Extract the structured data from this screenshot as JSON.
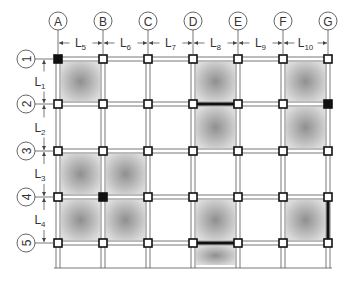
{
  "diagram": {
    "type": "structural-grid-plan",
    "columns": [
      "A",
      "B",
      "C",
      "D",
      "E",
      "F",
      "G"
    ],
    "rows": [
      "1",
      "2",
      "3",
      "4",
      "5"
    ],
    "column_x": [
      58,
      103,
      148,
      193,
      238,
      283,
      328
    ],
    "row_y": [
      59,
      104,
      151,
      197,
      243
    ],
    "span_labels_horizontal": [
      {
        "base": "L",
        "sub": "5"
      },
      {
        "base": "L",
        "sub": "6"
      },
      {
        "base": "L",
        "sub": "7"
      },
      {
        "base": "L",
        "sub": "8"
      },
      {
        "base": "L",
        "sub": "9"
      },
      {
        "base": "L",
        "sub": "10"
      }
    ],
    "span_labels_vertical": [
      {
        "base": "L",
        "sub": "1"
      },
      {
        "base": "L",
        "sub": "2"
      },
      {
        "base": "L",
        "sub": "3"
      },
      {
        "base": "L",
        "sub": "4"
      }
    ],
    "shaded_panels": [
      {
        "col": 0,
        "row": 0
      },
      {
        "col": 3,
        "row": 0
      },
      {
        "col": 3,
        "row": 1
      },
      {
        "col": 5,
        "row": 0
      },
      {
        "col": 5,
        "row": 1
      },
      {
        "col": 0,
        "row": 2
      },
      {
        "col": 1,
        "row": 2
      },
      {
        "col": 0,
        "row": 3
      },
      {
        "col": 1,
        "row": 3
      },
      {
        "col": 3,
        "row": 3
      },
      {
        "col": 3,
        "row": 4
      },
      {
        "col": 5,
        "row": 3
      }
    ],
    "solid_nodes": [
      {
        "col": 0,
        "row": 0
      },
      {
        "col": 6,
        "row": 1
      },
      {
        "col": 1,
        "row": 3
      }
    ],
    "heavy_beams": [
      {
        "from": {
          "col": 3,
          "row": 1
        },
        "to": {
          "col": 4,
          "row": 1
        }
      },
      {
        "from": {
          "col": 3,
          "row": 4
        },
        "to": {
          "col": 4,
          "row": 4
        }
      },
      {
        "from": {
          "col": 6,
          "row": 3
        },
        "to": {
          "col": 6,
          "row": 4
        }
      }
    ],
    "colors": {
      "line": "#555555",
      "node_fill": "#ffffff",
      "node_solid": "#111111",
      "shade": "#8a8a8a"
    }
  }
}
